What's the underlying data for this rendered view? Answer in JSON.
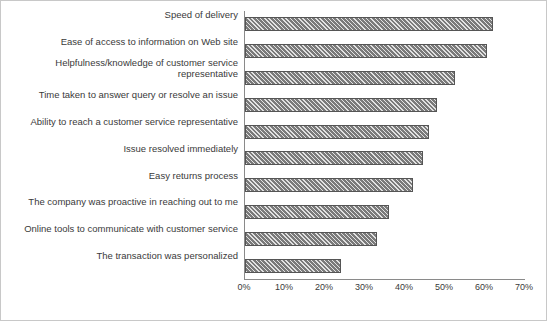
{
  "chart_data": {
    "type": "bar",
    "orientation": "horizontal",
    "title": "",
    "xlabel": "",
    "ylabel": "",
    "xlim": [
      0,
      70
    ],
    "xunit": "%",
    "grid": false,
    "legend": null,
    "tick_labels": [
      "0%",
      "10%",
      "20%",
      "30%",
      "40%",
      "50%",
      "60%",
      "70%"
    ],
    "tick_values": [
      0,
      10,
      20,
      30,
      40,
      50,
      60,
      70
    ],
    "categories": [
      "Speed of delivery",
      "Ease of access to information on Web site",
      "Helpfulness/knowledge of customer service\nrepresentative",
      "Time taken to answer query or resolve an issue",
      "Ability to reach a customer service representative",
      "Issue resolved immediately",
      "Easy returns process",
      "The company was proactive in reaching out to me",
      "Online tools to communicate with customer service",
      "The transaction was personalized"
    ],
    "values": [
      62,
      60.5,
      52.5,
      48,
      46,
      44.5,
      42,
      36,
      33,
      24
    ],
    "bar_color": "#7a7a7a",
    "bar_edge_color": "#555555",
    "bar_pattern": "hatched"
  }
}
